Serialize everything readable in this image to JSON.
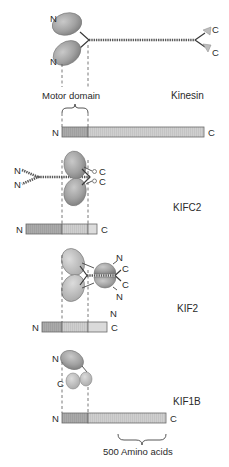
{
  "figure": {
    "motor_domain_label": "Motor domain",
    "scale_label": "500 Amino acids",
    "colors": {
      "motor_head": "#9e9e9e",
      "motor_segment": "#a8a8a8",
      "mid_segment": "#c6c6c6",
      "tail_segment": "#d6d6d6",
      "outline": "#6a6a6a"
    },
    "proteins": [
      {
        "name": "Kinesin",
        "bar": {
          "n_label": "N",
          "c_label": "C",
          "segments": [
            "motor",
            "tail"
          ]
        },
        "structure": {
          "n_labels": [
            "N",
            "N"
          ],
          "c_labels": [
            "C",
            "C"
          ]
        }
      },
      {
        "name": "KIFC2",
        "bar": {
          "n_label": "N",
          "c_label": "C",
          "segments": [
            "stalk",
            "motor",
            "tail"
          ]
        },
        "structure": {
          "n_labels": [
            "N",
            "N"
          ],
          "c_labels": [
            "C",
            "C"
          ]
        }
      },
      {
        "name": "KIF2",
        "bar": {
          "n_label": "N",
          "c_label": "C",
          "segments": [
            "n-terminal",
            "motor",
            "tail"
          ]
        },
        "structure": {
          "n_labels": [
            "N",
            "N",
            "N"
          ],
          "c_labels": [
            "C",
            "C"
          ]
        }
      },
      {
        "name": "KIF1B",
        "bar": {
          "n_label": "N",
          "c_label": "C",
          "segments": [
            "motor",
            "tail"
          ]
        },
        "structure": {
          "n_labels": [
            "N"
          ],
          "c_labels": [
            "C"
          ]
        }
      }
    ]
  }
}
